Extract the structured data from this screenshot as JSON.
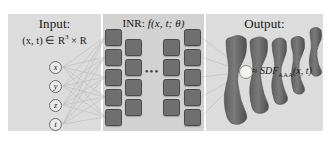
{
  "figure": {
    "caption_type": "diagram",
    "panels": {
      "input": {
        "title": "Input:",
        "domain": "(x, t) ∈ R",
        "domain_sup": "3",
        "domain_tail": " × R",
        "nodes": [
          {
            "label": "x"
          },
          {
            "label": "y"
          },
          {
            "label": "z"
          },
          {
            "label": "t"
          }
        ]
      },
      "inr": {
        "title_prefix": "INR: ",
        "title_fn": "f(x, t; θ)",
        "dots": "•••",
        "columns": [
          {
            "count": 5
          },
          {
            "count": 4
          },
          {
            "count": 4
          },
          {
            "count": 5
          }
        ]
      },
      "output": {
        "title": "Output:",
        "formula_approx": "≈ ",
        "formula_name": "SDF",
        "formula_sub": "AAA",
        "formula_args": "(x, t)",
        "shape_count": 5,
        "shape_name": "bone-mesh"
      }
    },
    "colors": {
      "panel_bg": "#dcdcdc",
      "panel_bg_inr": "#d2d2d2",
      "block": "#6f6f6f",
      "node": "#e9e9e9",
      "edge": "#b0b0b0",
      "bone": "#6b6b6b",
      "marker": "#f4f3ef",
      "text": "#161616"
    }
  }
}
